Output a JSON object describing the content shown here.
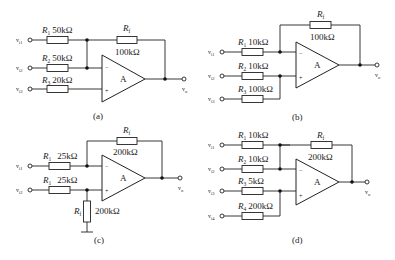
{
  "circuits": [
    {
      "id": "a",
      "caption": "(a)",
      "opamp_label": "A",
      "inputs": [
        {
          "name": "v",
          "sub": "i1",
          "resistor": "R",
          "rsub": "1",
          "value": "50kΩ",
          "node": "inverting"
        },
        {
          "name": "v",
          "sub": "i2",
          "resistor": "R",
          "rsub": "2",
          "value": "50kΩ",
          "node": "inverting"
        },
        {
          "name": "v",
          "sub": "i3",
          "resistor": "R",
          "rsub": "3",
          "value": "20kΩ",
          "node": "non-inverting"
        }
      ],
      "feedback": {
        "resistor": "R",
        "rsub": "f",
        "value": "100kΩ"
      },
      "output": {
        "name": "v",
        "sub": "o"
      }
    },
    {
      "id": "b",
      "caption": "(b)",
      "opamp_label": "A",
      "inputs": [
        {
          "name": "v",
          "sub": "i1",
          "resistor": "R",
          "rsub": "1",
          "value": "10kΩ",
          "node": "inverting"
        },
        {
          "name": "v",
          "sub": "i2",
          "resistor": "R",
          "rsub": "2",
          "value": "10kΩ",
          "node": "non-inverting"
        },
        {
          "name": "v",
          "sub": "i3",
          "resistor": "R",
          "rsub": "3",
          "value": "100kΩ",
          "node": "non-inverting"
        }
      ],
      "feedback": {
        "resistor": "R",
        "rsub": "f",
        "value": "100kΩ"
      },
      "output": {
        "name": "v",
        "sub": "o"
      }
    },
    {
      "id": "c",
      "caption": "(c)",
      "opamp_label": "A",
      "inputs": [
        {
          "name": "v",
          "sub": "i1",
          "resistor": "R",
          "rsub": "1",
          "value": "25kΩ",
          "node": "inverting"
        },
        {
          "name": "v",
          "sub": "i2",
          "resistor": "R",
          "rsub": "1",
          "value": "25kΩ",
          "node": "non-inverting"
        }
      ],
      "feedback": {
        "resistor": "R",
        "rsub": "f",
        "value": "200kΩ"
      },
      "ground_resistor": {
        "resistor": "R",
        "rsub": "f",
        "value": "200kΩ"
      },
      "output": {
        "name": "v",
        "sub": "o"
      }
    },
    {
      "id": "d",
      "caption": "(d)",
      "opamp_label": "A",
      "inputs": [
        {
          "name": "v",
          "sub": "i1",
          "resistor": "R",
          "rsub": "1",
          "value": "10kΩ",
          "node": "inverting"
        },
        {
          "name": "v",
          "sub": "i2",
          "resistor": "R",
          "rsub": "2",
          "value": "10kΩ",
          "node": "inverting"
        },
        {
          "name": "v",
          "sub": "i3",
          "resistor": "R",
          "rsub": "3",
          "value": "5kΩ",
          "node": "non-inverting"
        },
        {
          "name": "v",
          "sub": "i4",
          "resistor": "R",
          "rsub": "4",
          "value": "200kΩ",
          "node": "non-inverting"
        }
      ],
      "feedback": {
        "resistor": "R",
        "rsub": "f",
        "value": "200kΩ"
      },
      "output": {
        "name": "v",
        "sub": "o"
      }
    }
  ],
  "symbols": {
    "minus": "−",
    "plus": "+"
  }
}
